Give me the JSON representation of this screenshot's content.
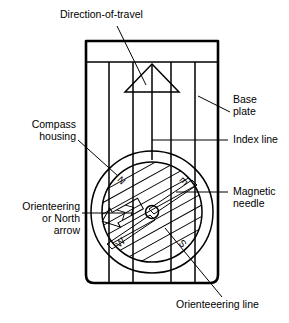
{
  "figure": {
    "background_color": "#ffffff",
    "line_color": "#000000"
  },
  "labels": {
    "direction_of_travel": "Direction-of-travel",
    "base_plate_line1": "Base",
    "base_plate_line2": "plate",
    "index_line": "Index line",
    "compass_housing_line1": "Compass",
    "compass_housing_line2": "housing",
    "magnetic_needle_line1": "Magnetic",
    "magnetic_needle_line2": "needle",
    "orienteering_arrow_line1": "Orienteering",
    "orienteering_arrow_line2": "or North",
    "orienteering_arrow_line3": "arrow",
    "orienteering_line": "Orienteeering line"
  },
  "bezel": {
    "north": "N",
    "east": "E",
    "south": "S",
    "west": "W"
  },
  "parts": [
    "base-plate",
    "direction-of-travel-arrow",
    "index-line",
    "compass-housing",
    "magnetic-needle",
    "orienteering-arrow",
    "orienteering-lines"
  ]
}
